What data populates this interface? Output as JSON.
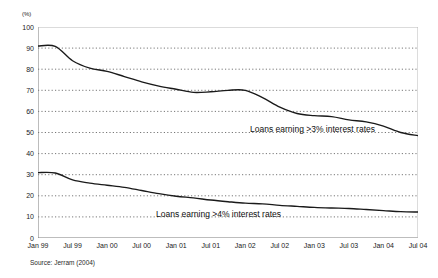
{
  "chart_data": {
    "type": "line",
    "title": "",
    "subtitle": "",
    "xlabel": "",
    "ylabel": "",
    "unit_label": "(%)",
    "ylim": [
      0,
      100
    ],
    "ytick_step": 10,
    "yticks": [
      0,
      10,
      20,
      30,
      40,
      50,
      60,
      70,
      80,
      90,
      100
    ],
    "grid": "horizontal-dotted",
    "legend_position": "inline-annotation",
    "categories": [
      "Jan 99",
      "Jul 99",
      "Jan 00",
      "Jul 00",
      "Jan 01",
      "Jul 01",
      "Jan 02",
      "Jul 02",
      "Jan 03",
      "Jul 03",
      "Jan 04",
      "Jul 04"
    ],
    "x_tick_labels": [
      "Jan 99",
      "Jul 99",
      "Jan 00",
      "Jul 00",
      "Jan 01",
      "Jul 01",
      "Jan 02",
      "Jul 02",
      "Jan 03",
      "Jul 03",
      "Jan 04",
      "Jul 04"
    ],
    "series": [
      {
        "name": "Loans earning >3% interest rates",
        "color": "#1a1a1a",
        "x": [
          "Jan 99",
          "Apr 99",
          "Jul 99",
          "Oct 99",
          "Jan 00",
          "Apr 00",
          "Jul 00",
          "Oct 00",
          "Jan 01",
          "Apr 01",
          "Jul 01",
          "Oct 01",
          "Jan 02",
          "Apr 02",
          "Jul 02",
          "Oct 02",
          "Jan 03",
          "Apr 03",
          "Jul 03",
          "Oct 03",
          "Jan 04",
          "Apr 04",
          "Jul 04"
        ],
        "values": [
          91.0,
          90.8,
          84.0,
          80.5,
          79.0,
          76.5,
          74.0,
          72.0,
          70.5,
          69.0,
          69.3,
          70.0,
          70.0,
          66.5,
          62.0,
          59.0,
          58.0,
          57.5,
          56.0,
          55.0,
          53.0,
          50.0,
          48.5
        ]
      },
      {
        "name": "Loans earning >4% interest rates",
        "color": "#1a1a1a",
        "x": [
          "Jan 99",
          "Apr 99",
          "Jul 99",
          "Oct 99",
          "Jan 00",
          "Apr 00",
          "Jul 00",
          "Oct 00",
          "Jan 01",
          "Apr 01",
          "Jul 01",
          "Oct 01",
          "Jan 02",
          "Apr 02",
          "Jul 02",
          "Oct 02",
          "Jan 03",
          "Apr 03",
          "Jul 03",
          "Oct 03",
          "Jan 04",
          "Apr 04",
          "Jul 04"
        ],
        "values": [
          31.0,
          30.8,
          27.5,
          26.0,
          25.0,
          24.0,
          22.5,
          21.0,
          19.8,
          19.0,
          18.0,
          17.2,
          16.5,
          16.2,
          15.5,
          15.0,
          14.5,
          14.2,
          14.0,
          13.5,
          13.0,
          12.5,
          12.3
        ]
      }
    ],
    "annotations": [
      {
        "text": "Loans earning >3% interest rates",
        "series": "Loans earning >3% interest rates"
      },
      {
        "text": "Loans earning >4% interest rates",
        "series": "Loans earning >4% interest rates"
      }
    ],
    "source": "Source: Jerram (2004)"
  }
}
